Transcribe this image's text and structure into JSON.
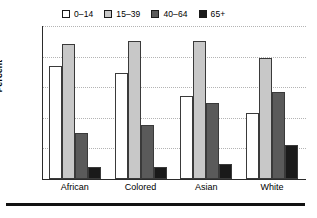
{
  "chart_data": {
    "type": "bar",
    "title": "",
    "xlabel": "",
    "ylabel": "Percent",
    "ylim": [
      0,
      50
    ],
    "yticks": [
      0,
      10,
      20,
      30,
      40,
      50
    ],
    "grid": true,
    "legend_position": "top",
    "categories": [
      "African",
      "Colored",
      "Asian",
      "White"
    ],
    "series": [
      {
        "name": "0–14",
        "color": "#ffffff",
        "values": [
          37,
          34.5,
          27,
          21.5
        ]
      },
      {
        "name": "15–39",
        "color": "#c8c8c8",
        "values": [
          44,
          45,
          45,
          39.5
        ]
      },
      {
        "name": "40–64",
        "color": "#5a5a5a",
        "values": [
          15,
          17.5,
          25,
          28.5
        ]
      },
      {
        "name": "65+",
        "color": "#1a1a1a",
        "values": [
          4,
          4,
          5,
          11
        ]
      }
    ]
  },
  "axis": {
    "y_title": "Percent",
    "y_tick_labels": [
      "50",
      "40",
      "30",
      "20",
      "10",
      "0"
    ],
    "x_tick_labels": [
      "African",
      "Colored",
      "Asian",
      "White"
    ]
  },
  "legend": {
    "items": [
      {
        "label": "0–14",
        "swatch": "#ffffff"
      },
      {
        "label": "15–39",
        "swatch": "#c8c8c8"
      },
      {
        "label": "40–64",
        "swatch": "#5a5a5a"
      },
      {
        "label": "65+",
        "swatch": "#1a1a1a"
      }
    ]
  }
}
